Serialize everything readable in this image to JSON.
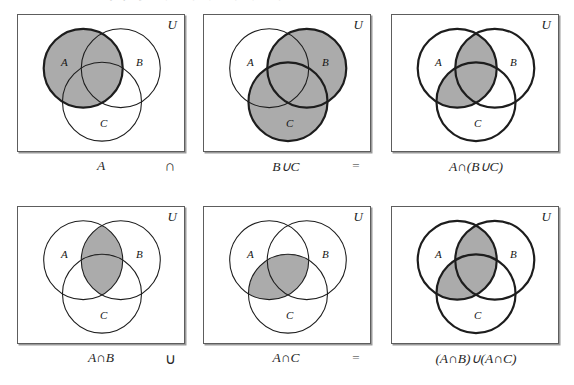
{
  "figure": {
    "top_cut_text": "distributive property    A ∩ (B ∪ C) = (A ∩ B) ∪ (A ∩ C)",
    "shade_color": "#ababab",
    "outline_color": "#1d1d1d",
    "border_color": "#5d5d5d",
    "universe_label": "U",
    "set_labels": {
      "a": "A",
      "b": "B",
      "c": "C"
    }
  },
  "rows": [
    {
      "name": "row-1",
      "panels": [
        {
          "id": "panel-a",
          "universe_label": "U",
          "labels": {
            "a": "A",
            "b": "B",
            "c": "C"
          },
          "shaded_regions": "A (entire circle A)",
          "bold_circles": "A",
          "caption": "A",
          "caption_kind": "term"
        },
        {
          "id": "panel-b-union-c",
          "universe_label": "U",
          "labels": {
            "a": "A",
            "b": "B",
            "c": "C"
          },
          "shaded_regions": "B ∪ C (circles B and C)",
          "bold_circles": "B, C",
          "caption": "B∪C",
          "caption_kind": "term"
        },
        {
          "id": "panel-a-cap-b-union-c",
          "universe_label": "U",
          "labels": {
            "a": "A",
            "b": "B",
            "c": "C"
          },
          "shaded_regions": "A ∩ (B ∪ C)",
          "bold_circles": "A, B, C",
          "caption": "A∩(B∪C)",
          "caption_kind": "term"
        }
      ],
      "operator": "∩",
      "equals": "="
    },
    {
      "name": "row-2",
      "panels": [
        {
          "id": "panel-a-cap-b",
          "universe_label": "U",
          "labels": {
            "a": "A",
            "b": "B",
            "c": "C"
          },
          "shaded_regions": "A ∩ B",
          "bold_circles": "none",
          "caption": "A∩B",
          "caption_kind": "term"
        },
        {
          "id": "panel-a-cap-c",
          "universe_label": "U",
          "labels": {
            "a": "A",
            "b": "B",
            "c": "C"
          },
          "shaded_regions": "A ∩ C",
          "bold_circles": "none",
          "caption": "A∩C",
          "caption_kind": "term"
        },
        {
          "id": "panel-union-result",
          "universe_label": "U",
          "labels": {
            "a": "A",
            "b": "B",
            "c": "C"
          },
          "shaded_regions": "(A ∩ B) ∪ (A ∩ C)",
          "bold_circles": "A, B, C",
          "caption": "(A∩B)∪(A∩C)",
          "caption_kind": "term"
        }
      ],
      "operator": "∪",
      "equals": "="
    }
  ]
}
